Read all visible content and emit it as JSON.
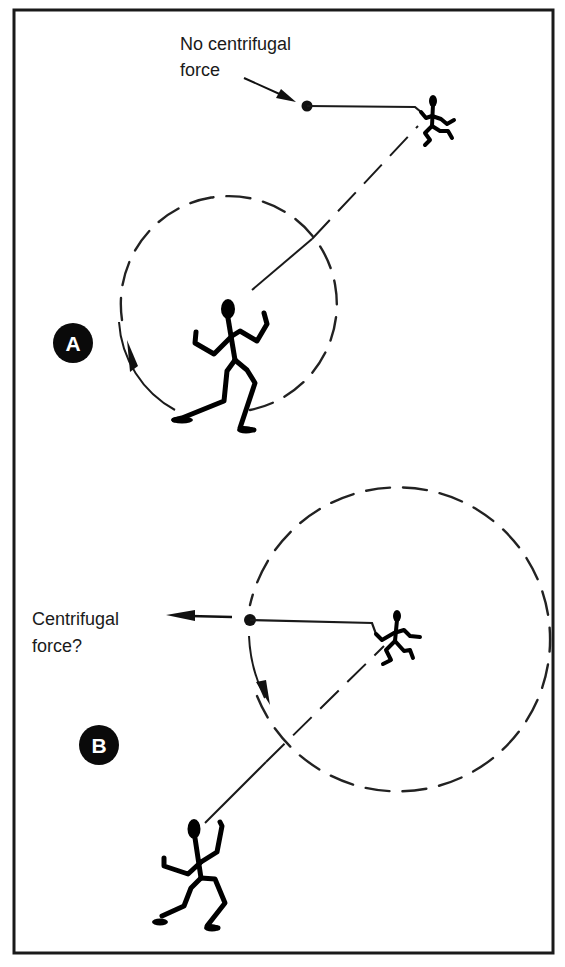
{
  "figure": {
    "panels": [
      {
        "id": "A",
        "badge": "A",
        "annotation_lines": [
          "No centrifugal",
          "force"
        ],
        "description": "Thrower spinning; released ball flies off tangentially (straight line), no outward force"
      },
      {
        "id": "B",
        "badge": "B",
        "annotation_lines": [
          "Centrifugal",
          "force?"
        ],
        "description": "Rotating observer perceives an outward (centrifugal) force on the ball"
      }
    ],
    "colors": {
      "ink": "#1a1a1a",
      "badge_fill": "#0a0a0a",
      "badge_text": "#ffffff",
      "background": "#ffffff"
    }
  }
}
